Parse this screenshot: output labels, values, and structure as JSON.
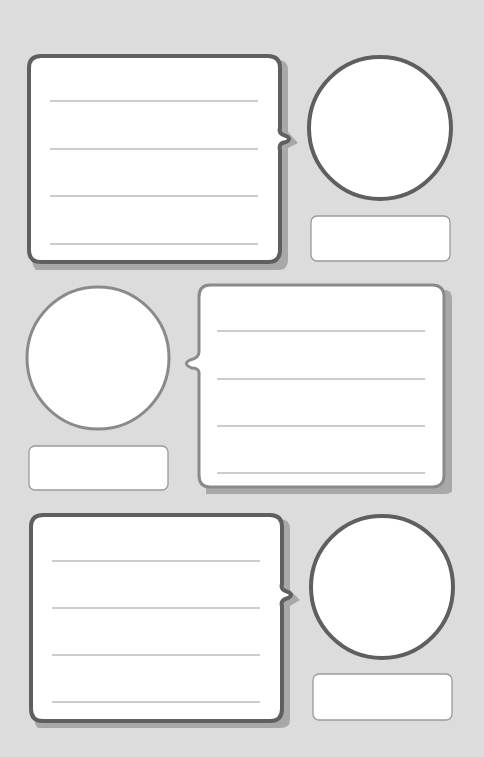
{
  "worksheet": {
    "background_color": "#dcdcdc",
    "border_dark": "#5f5f5f",
    "border_light": "#9a9a9a",
    "shadow_color": "#a8a8a8",
    "fill_color": "#ffffff",
    "rows": [
      {
        "layout": "speech-left",
        "speech_box": {
          "x": 29,
          "y": 55,
          "w": 252,
          "h": 207,
          "lines": 4,
          "tail": "right"
        },
        "portrait_circle": {
          "cx": 380,
          "cy": 128,
          "r": 71
        },
        "name_box": {
          "x": 311,
          "y": 216,
          "w": 139,
          "h": 45
        }
      },
      {
        "layout": "speech-right",
        "speech_box": {
          "x": 199,
          "y": 284,
          "w": 245,
          "h": 203,
          "lines": 4,
          "tail": "left"
        },
        "portrait_circle": {
          "cx": 98,
          "cy": 358,
          "r": 71
        },
        "name_box": {
          "x": 29,
          "y": 446,
          "w": 139,
          "h": 44
        }
      },
      {
        "layout": "speech-left",
        "speech_box": {
          "x": 31,
          "y": 514,
          "w": 251,
          "h": 207,
          "lines": 4,
          "tail": "right"
        },
        "portrait_circle": {
          "cx": 382,
          "cy": 587,
          "r": 71
        },
        "name_box": {
          "x": 313,
          "y": 674,
          "w": 139,
          "h": 46
        }
      }
    ]
  }
}
